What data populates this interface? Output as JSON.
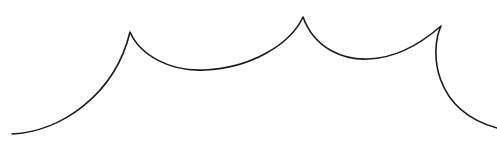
{
  "drawing": {
    "description": "Hand-drawn wavy line with three cusp peaks",
    "stroke_color": "#1a1a1a",
    "stroke_width": 1.6,
    "background": "#ffffff",
    "points": {
      "start": [
        12,
        134
      ],
      "peak_1": [
        130,
        32
      ],
      "trough_1": [
        205,
        70
      ],
      "peak_2": [
        303,
        17
      ],
      "trough_2": [
        365,
        59
      ],
      "peak_3": [
        441,
        26
      ],
      "end": [
        497,
        128
      ]
    }
  }
}
